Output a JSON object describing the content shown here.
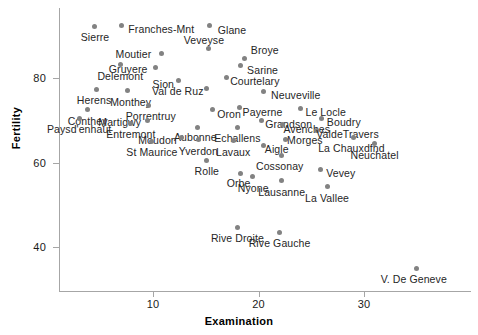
{
  "chart_data": {
    "type": "scatter",
    "title": "",
    "xlabel": "Examination",
    "ylabel": "Fertility",
    "xlim": [
      2.5,
      36.5
    ],
    "ylim": [
      33.5,
      93.5
    ],
    "xticks": [
      10,
      20,
      30
    ],
    "yticks": [
      40,
      60,
      80
    ],
    "grid": false,
    "legend": "none",
    "point_color": "#828282",
    "axis_color": "#a6a6a6",
    "label_color": "#262626",
    "points": [
      {
        "label": "Sierre",
        "x": 4.5,
        "y": 92.2,
        "lx": 0,
        "ly": 11
      },
      {
        "label": "Franches-Mnt",
        "x": 7.0,
        "y": 92.5,
        "lx": 40,
        "ly": 4
      },
      {
        "label": "Glane",
        "x": 15.4,
        "y": 92.4,
        "lx": 22,
        "ly": 4
      },
      {
        "label": "Veveyse",
        "x": 15.3,
        "y": 87.1,
        "lx": -5,
        "ly": -8
      },
      {
        "label": "Moutier",
        "x": 10.8,
        "y": 85.8,
        "lx": -28,
        "ly": 1
      },
      {
        "label": "Broye",
        "x": 18.7,
        "y": 84.6,
        "lx": 20,
        "ly": -9
      },
      {
        "label": "Delemont",
        "x": 6.9,
        "y": 83.1,
        "lx": 0,
        "ly": 11
      },
      {
        "label": "Sarine",
        "x": 18.3,
        "y": 82.9,
        "lx": 22,
        "ly": 4
      },
      {
        "label": "Gruyere",
        "x": 10.2,
        "y": 82.4,
        "lx": -27,
        "ly": 1
      },
      {
        "label": "Courtelary",
        "x": 17.0,
        "y": 80.2,
        "lx": 28,
        "ly": 4
      },
      {
        "label": "Sion",
        "x": 12.4,
        "y": 79.3,
        "lx": -15,
        "ly": 3
      },
      {
        "label": "Herens",
        "x": 4.6,
        "y": 77.3,
        "lx": -2,
        "ly": 11
      },
      {
        "label": "Monthey",
        "x": 7.6,
        "y": 77.0,
        "lx": 3,
        "ly": 11
      },
      {
        "label": "Neuveville",
        "x": 20.5,
        "y": 76.9,
        "lx": 32,
        "ly": 4
      },
      {
        "label": "Val de Ruz",
        "x": 15.1,
        "y": 77.6,
        "lx": -29,
        "ly": 3
      },
      {
        "label": "Payerne",
        "x": 18.2,
        "y": 73.0,
        "lx": 23,
        "ly": 4
      },
      {
        "label": "Porrentruy",
        "x": 9.6,
        "y": 73.5,
        "lx": 2,
        "ly": 11
      },
      {
        "label": "Conthey",
        "x": 3.8,
        "y": 72.5,
        "lx": 0,
        "ly": 11
      },
      {
        "label": "Oron",
        "x": 15.6,
        "y": 72.5,
        "lx": 17,
        "ly": 4
      },
      {
        "label": "Le Locle",
        "x": 24.0,
        "y": 72.7,
        "lx": 25,
        "ly": 3
      },
      {
        "label": "Paysd'enhaut",
        "x": 3.0,
        "y": 70.5,
        "lx": 0,
        "ly": 11
      },
      {
        "label": "Martigwy",
        "x": 9.5,
        "y": 70.0,
        "lx": -28,
        "ly": 2
      },
      {
        "label": "Grandson",
        "x": 20.3,
        "y": 70.0,
        "lx": 27,
        "ly": 4
      },
      {
        "label": "Boudry",
        "x": 26.0,
        "y": 70.4,
        "lx": 22,
        "ly": 3
      },
      {
        "label": "Entremont",
        "x": 7.9,
        "y": 69.3,
        "lx": 0,
        "ly": 11
      },
      {
        "label": "Aubonne",
        "x": 14.2,
        "y": 68.3,
        "lx": -2,
        "ly": 10
      },
      {
        "label": "Avenches",
        "x": 22.3,
        "y": 68.9,
        "lx": 24,
        "ly": 4
      },
      {
        "label": "ValdeTravers",
        "x": 25.5,
        "y": 67.6,
        "lx": 31,
        "ly": 4
      },
      {
        "label": "Echallens",
        "x": 18.0,
        "y": 68.3,
        "lx": 0,
        "ly": 11
      },
      {
        "label": "Moudon",
        "x": 12.7,
        "y": 65.8,
        "lx": -24,
        "ly": 2
      },
      {
        "label": "Morges",
        "x": 22.6,
        "y": 65.5,
        "lx": 19,
        "ly": 1
      },
      {
        "label": "La Chauxdfnd",
        "x": 29.0,
        "y": 65.8,
        "lx": -2,
        "ly": 10
      },
      {
        "label": "Yverdon",
        "x": 14.3,
        "y": 65.4,
        "lx": 0,
        "ly": 11
      },
      {
        "label": "Lavaux",
        "x": 17.6,
        "y": 65.1,
        "lx": 0,
        "ly": 11
      },
      {
        "label": "Aigle",
        "x": 20.5,
        "y": 64.1,
        "lx": 13,
        "ly": 4
      },
      {
        "label": "St Maurice",
        "x": 9.9,
        "y": 65.0,
        "lx": 0,
        "ly": 11
      },
      {
        "label": "Neuchatel",
        "x": 31.0,
        "y": 64.4,
        "lx": 0,
        "ly": 11
      },
      {
        "label": "Cossonay",
        "x": 22.2,
        "y": 61.7,
        "lx": -2,
        "ly": 11
      },
      {
        "label": "Rolle",
        "x": 15.1,
        "y": 60.5,
        "lx": 0,
        "ly": 11
      },
      {
        "label": "Vevey",
        "x": 25.9,
        "y": 58.3,
        "lx": 20,
        "ly": 3
      },
      {
        "label": "Orbe",
        "x": 18.3,
        "y": 57.4,
        "lx": -2,
        "ly": 10
      },
      {
        "label": "Nyone",
        "x": 19.4,
        "y": 56.6,
        "lx": 1,
        "ly": 11
      },
      {
        "label": "Lausanne",
        "x": 22.2,
        "y": 55.7,
        "lx": 0,
        "ly": 11
      },
      {
        "label": "La Vallee",
        "x": 26.5,
        "y": 54.3,
        "lx": 0,
        "ly": 11
      },
      {
        "label": "Rive Droite",
        "x": 18.0,
        "y": 44.7,
        "lx": 0,
        "ly": 11
      },
      {
        "label": "Rive Gauche",
        "x": 22.0,
        "y": 43.5,
        "lx": 0,
        "ly": 11
      },
      {
        "label": "V. De Geneve",
        "x": 35.0,
        "y": 35.0,
        "lx": -3,
        "ly": 11
      }
    ]
  }
}
